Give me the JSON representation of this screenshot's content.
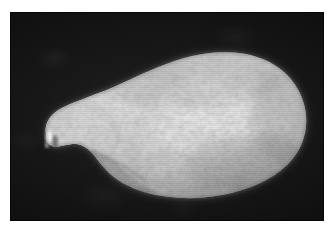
{
  "page": {
    "background_color": "#ffffff",
    "width": 336,
    "height": 233,
    "caption": ""
  },
  "photo": {
    "name": "specimen-photograph",
    "kind": "grayscale-photograph",
    "background_color": "#101010",
    "frame": {
      "left": 10,
      "top": 12,
      "width": 314,
      "height": 209
    },
    "alt_text": "Grayscale photograph of a pale ovoid specimen with a mottled pitted surface and a tapered left end, on a black background",
    "subject": {
      "name": "ovoid-specimen",
      "description": "pale pear-shaped specimen, bulbous right end, tapered narrow left end",
      "surface_texture": "mottled, pitted, finely speckled",
      "highlight_color": "#fbfbfb",
      "midtone_color": "#d6d6d6",
      "shadow_color": "#8e8e8e",
      "speckle_color": "#9a9a9a",
      "tip_highlight_color": "#ffffff"
    }
  }
}
